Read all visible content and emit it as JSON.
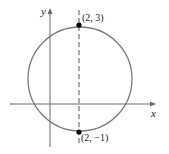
{
  "diagram": {
    "axes": {
      "x_label": "x",
      "y_label": "y"
    },
    "circle": {
      "center": [
        2,
        1
      ],
      "radius": 2
    },
    "points": [
      {
        "label": "(2, 3)",
        "coords": [
          2,
          3
        ]
      },
      {
        "label": "(2, −1)",
        "coords": [
          2,
          -1
        ]
      }
    ],
    "dashed_line": {
      "x": 2
    },
    "colors": {
      "circle": "#7a7a7a",
      "axes": "#6a6a6a",
      "point": "#000000",
      "dashed": "#555555"
    }
  }
}
